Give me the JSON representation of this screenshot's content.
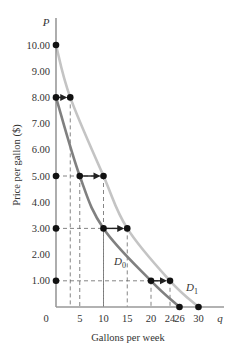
{
  "chart_data": {
    "type": "line",
    "title": "",
    "xlabel": "Gallons per week",
    "ylabel": "Price per gallon ($)",
    "x_axis_symbol": "q",
    "y_axis_symbol": "P",
    "origin_label": "0",
    "xlim": [
      0,
      32
    ],
    "ylim": [
      0,
      10.5
    ],
    "grid": false,
    "x_ticks": [
      5,
      10,
      15,
      20,
      24,
      26,
      30
    ],
    "y_ticks": [
      1.0,
      2.0,
      3.0,
      4.0,
      5.0,
      6.0,
      7.0,
      8.0,
      9.0,
      10.0
    ],
    "y_tick_labels": [
      "1.00",
      "2.00",
      "3.00",
      "4.00",
      "5.00",
      "6.00",
      "7.00",
      "8.00",
      "9.00",
      "10.00"
    ],
    "series": [
      {
        "name": "D0",
        "label_main": "D",
        "label_sub": "0",
        "color": "#808080",
        "points": [
          [
            0,
            8.0
          ],
          [
            5,
            5.0
          ],
          [
            10,
            3.0
          ],
          [
            20,
            1.0
          ],
          [
            26,
            0
          ]
        ]
      },
      {
        "name": "D1",
        "label_main": "D",
        "label_sub": "1",
        "color": "#c4c4c4",
        "points": [
          [
            0,
            10.0
          ],
          [
            3,
            8.0
          ],
          [
            10,
            5.0
          ],
          [
            15,
            3.0
          ],
          [
            24,
            1.0
          ],
          [
            30,
            0
          ]
        ]
      }
    ],
    "shifts": [
      {
        "price": 8.0,
        "from_q": 0,
        "to_q": 3
      },
      {
        "price": 5.0,
        "from_q": 5,
        "to_q": 10
      },
      {
        "price": 3.0,
        "from_q": 10,
        "to_q": 15
      },
      {
        "price": 1.0,
        "from_q": 20,
        "to_q": 24
      }
    ],
    "axis_points": [
      10.0,
      8.0,
      5.0,
      3.0,
      1.0
    ]
  }
}
